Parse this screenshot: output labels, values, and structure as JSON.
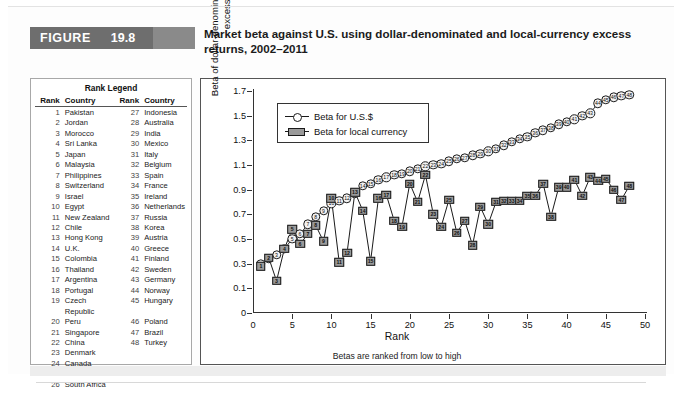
{
  "figure": {
    "badge_word": "FIGURE",
    "number": "19.8",
    "title": "Market beta against U.S. using dollar-denominated and local-currency excess returns, 2002–2011"
  },
  "rank_legend": {
    "title": "Rank Legend",
    "headers": {
      "rank": "Rank",
      "country": "Country",
      "rank2": "Rank",
      "country2": "Country"
    },
    "rows": [
      {
        "rank": "1",
        "country": "Pakistan",
        "rank2": "27",
        "country2": "Indonesia"
      },
      {
        "rank": "2",
        "country": "Jordan",
        "rank2": "28",
        "country2": "Australia"
      },
      {
        "rank": "3",
        "country": "Morocco",
        "rank2": "29",
        "country2": "India"
      },
      {
        "rank": "4",
        "country": "Sri Lanka",
        "rank2": "30",
        "country2": "Mexico"
      },
      {
        "rank": "5",
        "country": "Japan",
        "rank2": "31",
        "country2": "Italy"
      },
      {
        "rank": "6",
        "country": "Malaysia",
        "rank2": "32",
        "country2": "Belgium"
      },
      {
        "rank": "7",
        "country": "Philippines",
        "rank2": "33",
        "country2": "Spain"
      },
      {
        "rank": "8",
        "country": "Switzerland",
        "rank2": "34",
        "country2": "France"
      },
      {
        "rank": "9",
        "country": "Israel",
        "rank2": "35",
        "country2": "Ireland"
      },
      {
        "rank": "10",
        "country": "Egypt",
        "rank2": "36",
        "country2": "Netherlands"
      },
      {
        "rank": "11",
        "country": "New Zealand",
        "rank2": "37",
        "country2": "Russia"
      },
      {
        "rank": "12",
        "country": "Chile",
        "rank2": "38",
        "country2": "Korea"
      },
      {
        "rank": "13",
        "country": "Hong Kong",
        "rank2": "39",
        "country2": "Austria"
      },
      {
        "rank": "14",
        "country": "U.K.",
        "rank2": "40",
        "country2": "Greece"
      },
      {
        "rank": "15",
        "country": "Colombia",
        "rank2": "41",
        "country2": "Finland"
      },
      {
        "rank": "16",
        "country": "Thailand",
        "rank2": "42",
        "country2": "Sweden"
      },
      {
        "rank": "17",
        "country": "Argentina",
        "rank2": "43",
        "country2": "Germany"
      },
      {
        "rank": "18",
        "country": "Portugal",
        "rank2": "44",
        "country2": "Norway"
      },
      {
        "rank": "19",
        "country": "Czech Republic",
        "rank2": "45",
        "country2": "Hungary"
      },
      {
        "rank": "20",
        "country": "Peru",
        "rank2": "46",
        "country2": "Poland"
      },
      {
        "rank": "21",
        "country": "Singapore",
        "rank2": "47",
        "country2": "Brazil"
      },
      {
        "rank": "22",
        "country": "China",
        "rank2": "48",
        "country2": "Turkey"
      },
      {
        "rank": "23",
        "country": "Denmark",
        "rank2": "",
        "country2": ""
      },
      {
        "rank": "24",
        "country": "Canada",
        "rank2": "",
        "country2": ""
      },
      {
        "rank": "25",
        "country": "Taiwan",
        "rank2": "",
        "country2": ""
      },
      {
        "rank": "26",
        "country": "South Africa",
        "rank2": "",
        "country2": ""
      }
    ]
  },
  "chart_data": {
    "type": "line",
    "title": "",
    "xlabel": "Rank",
    "ylabel": "Beta of dollar-denominated and local-currency excess returns",
    "xnote": "Betas are ranked from low to high",
    "xlim": [
      0,
      50
    ],
    "ylim": [
      -0.1,
      1.7
    ],
    "xticks": [
      "0",
      "5",
      "10",
      "15",
      "20",
      "25",
      "30",
      "35",
      "40",
      "45",
      "50"
    ],
    "xtick_values": [
      0,
      5,
      10,
      15,
      20,
      25,
      30,
      35,
      40,
      45,
      50
    ],
    "yticks": [
      "0",
      "0.1",
      "0.3",
      "0.5",
      "0.7",
      "0.9",
      "1.1",
      "1.3",
      "1.5",
      "1.7"
    ],
    "ytick_values": [
      -0.1,
      0.1,
      0.3,
      0.5,
      0.7,
      0.9,
      1.1,
      1.3,
      1.5,
      1.7
    ],
    "grid": false,
    "legend_position": "upper-left",
    "x": [
      1,
      2,
      3,
      4,
      5,
      6,
      7,
      8,
      9,
      10,
      11,
      12,
      13,
      14,
      15,
      16,
      17,
      18,
      19,
      20,
      21,
      22,
      23,
      24,
      25,
      26,
      27,
      28,
      29,
      30,
      31,
      32,
      33,
      34,
      35,
      36,
      37,
      38,
      39,
      40,
      41,
      42,
      43,
      44,
      45,
      46,
      47,
      48
    ],
    "series": [
      {
        "name": "Beta for U.S.$",
        "marker": "open-circle",
        "color": "#ffffff",
        "values": [
          0.3,
          0.34,
          0.37,
          0.42,
          0.5,
          0.54,
          0.62,
          0.68,
          0.73,
          0.79,
          0.81,
          0.83,
          0.87,
          0.93,
          0.95,
          0.98,
          1.0,
          1.02,
          1.03,
          1.05,
          1.07,
          1.09,
          1.1,
          1.11,
          1.13,
          1.15,
          1.16,
          1.18,
          1.19,
          1.21,
          1.23,
          1.26,
          1.29,
          1.31,
          1.33,
          1.36,
          1.38,
          1.4,
          1.43,
          1.45,
          1.47,
          1.5,
          1.52,
          1.6,
          1.63,
          1.65,
          1.66,
          1.67
        ]
      },
      {
        "name": "Beta for local currency",
        "marker": "filled-square",
        "color": "#9a9a9a",
        "values": [
          0.28,
          0.35,
          0.16,
          0.42,
          0.58,
          0.46,
          0.54,
          0.61,
          0.48,
          0.83,
          0.31,
          0.39,
          0.88,
          0.73,
          0.32,
          0.83,
          0.86,
          0.65,
          0.6,
          0.95,
          0.8,
          1.02,
          0.7,
          0.6,
          0.82,
          0.55,
          0.65,
          0.45,
          0.76,
          0.62,
          0.8,
          0.81,
          0.81,
          0.81,
          0.85,
          0.85,
          0.95,
          0.68,
          0.92,
          0.92,
          0.98,
          0.85,
          1.0,
          0.97,
          0.99,
          0.9,
          0.82,
          0.93
        ]
      }
    ]
  },
  "chart_legend": {
    "entries": [
      {
        "label": "Beta for U.S.$",
        "marker": "open-circle"
      },
      {
        "label": "Beta for local currency",
        "marker": "filled-square"
      }
    ]
  }
}
